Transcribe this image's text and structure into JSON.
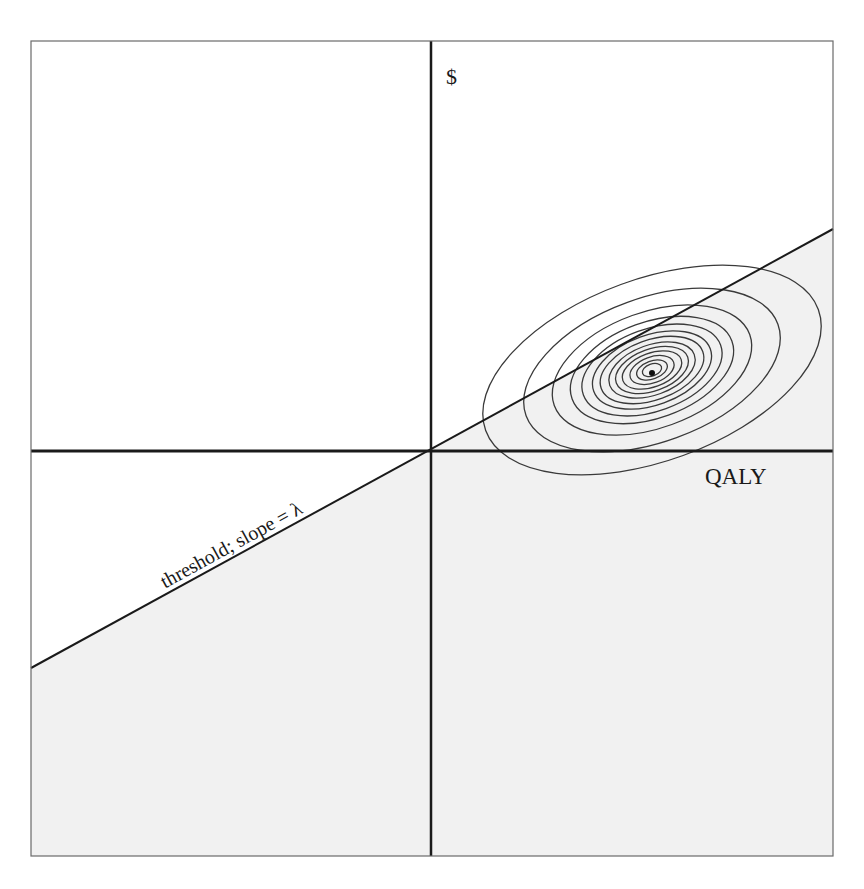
{
  "figure": {
    "frame": {
      "x": 31,
      "y": 41,
      "width": 802,
      "height": 815
    },
    "origin": {
      "x": 431,
      "y": 451
    },
    "colors": {
      "background": "#ffffff",
      "shaded_region": "#f1f1f1",
      "axis": "#1a1a1a",
      "frame": "#6a6a6a",
      "contour": "#3a3a3a",
      "threshold_line": "#1a1a1a"
    },
    "axes": {
      "y_label": "$",
      "x_label": "QALY"
    },
    "threshold": {
      "label": "threshold; slope = λ",
      "x1": 31,
      "y1": 668,
      "x2": 833,
      "y2": 229
    },
    "distribution": {
      "center": {
        "x": 652,
        "y": 370
      },
      "rotation_deg": -20,
      "ring_radii": [
        {
          "rx": 177,
          "ry": 91
        },
        {
          "rx": 134,
          "ry": 72
        },
        {
          "rx": 104,
          "ry": 58
        },
        {
          "rx": 85,
          "ry": 48
        },
        {
          "rx": 73,
          "ry": 41
        },
        {
          "rx": 62,
          "ry": 35
        },
        {
          "rx": 54,
          "ry": 30
        },
        {
          "rx": 45,
          "ry": 25
        },
        {
          "rx": 38,
          "ry": 21
        },
        {
          "rx": 31,
          "ry": 17
        },
        {
          "rx": 23,
          "ry": 13
        },
        {
          "rx": 16,
          "ry": 9
        },
        {
          "rx": 10,
          "ry": 6
        }
      ],
      "mean_marker_radius": 3
    }
  }
}
